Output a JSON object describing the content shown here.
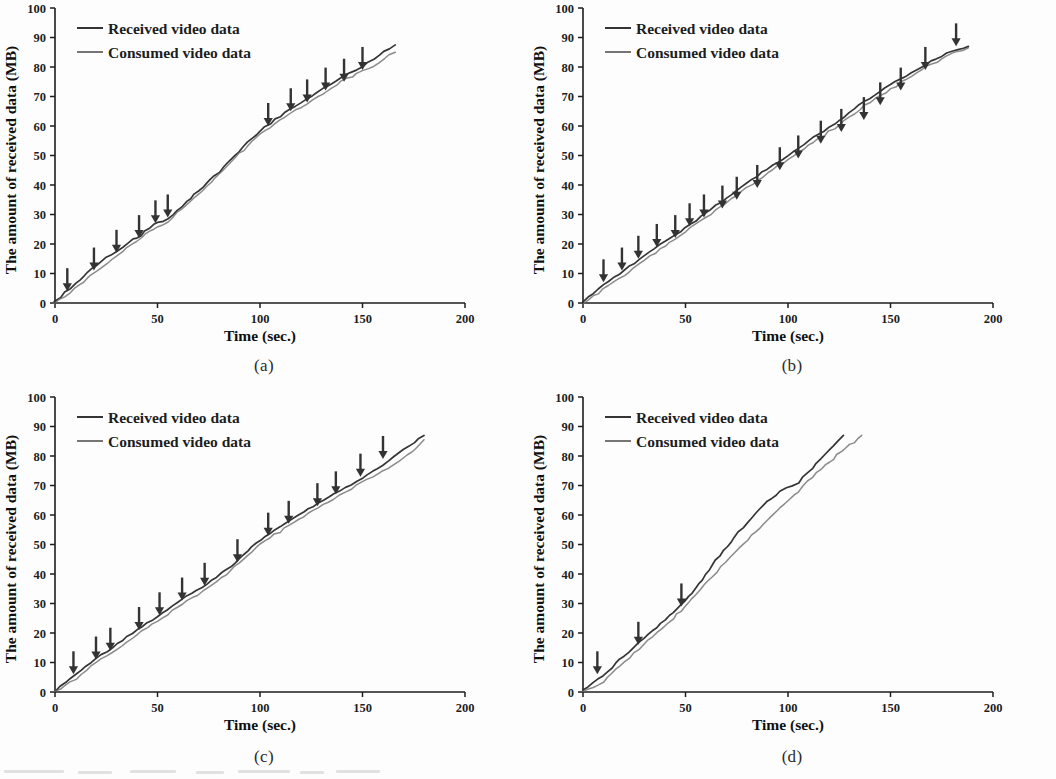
{
  "figure": {
    "background": "#fdfdfd",
    "ink": "#1d1d1d",
    "received_color": "#2a2a2a",
    "consumed_color": "#6e6e6e",
    "arrow_color": "#333333"
  },
  "axis": {
    "ylabel": "The amount of received data (MB)",
    "xlabel": "Time (sec.)",
    "yticks": [
      "100",
      "90",
      "80",
      "70",
      "60",
      "50",
      "40",
      "30",
      "20",
      "10",
      "0"
    ],
    "xticks": [
      "0",
      "50",
      "100",
      "150",
      "200"
    ],
    "ylim": [
      0,
      100
    ],
    "xlim": [
      0,
      200
    ]
  },
  "legend": {
    "received": "Received video data",
    "consumed": "Consumed video data"
  },
  "captions": {
    "a": "(a)",
    "b": "(b)",
    "c": "(c)",
    "d": "(d)"
  },
  "chart_data": [
    {
      "type": "line",
      "panel": "(a)",
      "title": "",
      "xlabel": "Time (sec.)",
      "ylabel": "The amount of received data (MB)",
      "xlim": [
        0,
        200
      ],
      "ylim": [
        0,
        100
      ],
      "grid": false,
      "legend_position": "top-left",
      "series": [
        {
          "name": "Received video data",
          "x": [
            0,
            5,
            10,
            18,
            25,
            30,
            38,
            42,
            48,
            55,
            62,
            70,
            80,
            90,
            100,
            105,
            112,
            120,
            128,
            135,
            142,
            150,
            158,
            166
          ],
          "y": [
            0.5,
            3.5,
            6.5,
            11.5,
            15.5,
            17.5,
            21.5,
            23.0,
            26.5,
            28.5,
            33.0,
            38.0,
            44.5,
            51.5,
            58.5,
            61.0,
            64.5,
            68.0,
            71.5,
            74.5,
            77.5,
            80.0,
            84.0,
            87.5
          ]
        },
        {
          "name": "Consumed video data",
          "x": [
            0,
            5,
            10,
            18,
            25,
            30,
            38,
            42,
            48,
            55,
            62,
            70,
            80,
            90,
            100,
            105,
            112,
            120,
            128,
            135,
            142,
            150,
            158,
            166
          ],
          "y": [
            0.0,
            2.0,
            5.0,
            9.5,
            13.5,
            16.0,
            20.0,
            22.0,
            25.0,
            27.5,
            32.0,
            37.0,
            43.5,
            50.5,
            57.5,
            59.5,
            63.0,
            66.5,
            70.0,
            73.0,
            76.0,
            78.5,
            81.5,
            85.0
          ]
        }
      ],
      "arrow_markers": [
        {
          "x": 6,
          "y": 4
        },
        {
          "x": 19,
          "y": 11
        },
        {
          "x": 30,
          "y": 17
        },
        {
          "x": 41,
          "y": 22
        },
        {
          "x": 49,
          "y": 27
        },
        {
          "x": 55,
          "y": 29
        },
        {
          "x": 104,
          "y": 60
        },
        {
          "x": 115,
          "y": 65
        },
        {
          "x": 123,
          "y": 68
        },
        {
          "x": 132,
          "y": 72
        },
        {
          "x": 141,
          "y": 75
        },
        {
          "x": 150,
          "y": 79
        }
      ]
    },
    {
      "type": "line",
      "panel": "(b)",
      "title": "",
      "xlabel": "Time (sec.)",
      "ylabel": "The amount of received data (MB)",
      "xlim": [
        0,
        200
      ],
      "ylim": [
        0,
        100
      ],
      "grid": false,
      "legend_position": "top-left",
      "series": [
        {
          "name": "Received video data",
          "x": [
            0,
            10,
            20,
            30,
            40,
            50,
            60,
            70,
            80,
            90,
            100,
            110,
            120,
            130,
            140,
            150,
            160,
            170,
            180,
            188
          ],
          "y": [
            0.5,
            6.0,
            11.0,
            16.0,
            21.0,
            25.5,
            30.5,
            35.5,
            40.5,
            45.5,
            50.0,
            55.0,
            59.5,
            64.5,
            69.5,
            74.0,
            78.0,
            82.0,
            85.5,
            87.0
          ]
        },
        {
          "name": "Consumed video data",
          "x": [
            0,
            10,
            20,
            30,
            40,
            50,
            60,
            70,
            80,
            90,
            100,
            110,
            120,
            130,
            140,
            150,
            160,
            170,
            180,
            188
          ],
          "y": [
            0.0,
            4.5,
            9.5,
            14.5,
            19.5,
            24.0,
            29.0,
            34.0,
            39.0,
            44.0,
            48.5,
            53.5,
            58.0,
            63.0,
            68.0,
            72.5,
            77.0,
            81.0,
            84.5,
            86.5
          ]
        }
      ],
      "arrow_markers": [
        {
          "x": 10,
          "y": 7
        },
        {
          "x": 19,
          "y": 11
        },
        {
          "x": 27,
          "y": 15
        },
        {
          "x": 36,
          "y": 19
        },
        {
          "x": 45,
          "y": 22
        },
        {
          "x": 52,
          "y": 26
        },
        {
          "x": 59,
          "y": 29
        },
        {
          "x": 68,
          "y": 32
        },
        {
          "x": 75,
          "y": 35
        },
        {
          "x": 85,
          "y": 39
        },
        {
          "x": 96,
          "y": 45
        },
        {
          "x": 105,
          "y": 49
        },
        {
          "x": 116,
          "y": 54
        },
        {
          "x": 126,
          "y": 58
        },
        {
          "x": 137,
          "y": 62
        },
        {
          "x": 145,
          "y": 67
        },
        {
          "x": 155,
          "y": 72
        },
        {
          "x": 167,
          "y": 79
        },
        {
          "x": 182,
          "y": 87
        }
      ]
    },
    {
      "type": "line",
      "panel": "(c)",
      "title": "",
      "xlabel": "Time (sec.)",
      "ylabel": "The amount of received data (MB)",
      "xlim": [
        0,
        200
      ],
      "ylim": [
        0,
        100
      ],
      "grid": false,
      "legend_position": "top-left",
      "series": [
        {
          "name": "Received video data",
          "x": [
            0,
            10,
            20,
            28,
            40,
            50,
            62,
            74,
            88,
            100,
            112,
            126,
            136,
            150,
            160,
            168,
            180
          ],
          "y": [
            0.5,
            6.0,
            11.5,
            15.0,
            21.0,
            25.5,
            31.5,
            36.5,
            44.0,
            51.5,
            57.0,
            63.0,
            67.0,
            72.5,
            77.0,
            81.0,
            87.0
          ]
        },
        {
          "name": "Consumed video data",
          "x": [
            0,
            10,
            20,
            28,
            40,
            50,
            62,
            74,
            88,
            100,
            112,
            126,
            136,
            150,
            160,
            168,
            180
          ],
          "y": [
            0.0,
            4.5,
            10.0,
            13.5,
            19.5,
            24.0,
            30.0,
            35.0,
            42.5,
            50.0,
            55.5,
            61.5,
            65.5,
            71.0,
            75.0,
            78.0,
            85.5
          ]
        }
      ],
      "arrow_markers": [
        {
          "x": 9,
          "y": 6
        },
        {
          "x": 20,
          "y": 11
        },
        {
          "x": 27,
          "y": 14
        },
        {
          "x": 41,
          "y": 21
        },
        {
          "x": 51,
          "y": 26
        },
        {
          "x": 62,
          "y": 31
        },
        {
          "x": 73,
          "y": 36
        },
        {
          "x": 89,
          "y": 44
        },
        {
          "x": 104,
          "y": 53
        },
        {
          "x": 114,
          "y": 57
        },
        {
          "x": 128,
          "y": 63
        },
        {
          "x": 137,
          "y": 67
        },
        {
          "x": 149,
          "y": 73
        },
        {
          "x": 160,
          "y": 79
        }
      ]
    },
    {
      "type": "line",
      "panel": "(d)",
      "title": "",
      "xlabel": "Time (sec.)",
      "ylabel": "The amount of received data (MB)",
      "xlim": [
        0,
        200
      ],
      "ylim": [
        0,
        100
      ],
      "grid": false,
      "legend_position": "top-left",
      "series": [
        {
          "name": "Received video data",
          "x": [
            0,
            5,
            10,
            18,
            25,
            32,
            40,
            48,
            55,
            63,
            72,
            80,
            88,
            96,
            105,
            112,
            120,
            127
          ],
          "y": [
            0.5,
            3.0,
            5.5,
            11.0,
            15.0,
            19.5,
            24.5,
            29.5,
            35.0,
            43.0,
            51.0,
            57.5,
            63.5,
            68.0,
            71.0,
            76.0,
            82.0,
            87.0
          ]
        },
        {
          "name": "Consumed video data",
          "x": [
            0,
            5,
            10,
            18,
            25,
            32,
            40,
            48,
            55,
            63,
            72,
            80,
            88,
            96,
            105,
            112,
            120,
            128,
            136
          ],
          "y": [
            0.0,
            1.5,
            3.5,
            9.0,
            13.0,
            17.5,
            22.5,
            27.5,
            33.0,
            39.0,
            45.5,
            51.5,
            57.0,
            62.5,
            68.0,
            73.0,
            78.0,
            82.5,
            87.0
          ]
        }
      ],
      "arrow_markers": [
        {
          "x": 7,
          "y": 6
        },
        {
          "x": 27,
          "y": 16
        },
        {
          "x": 48,
          "y": 29
        }
      ]
    }
  ]
}
